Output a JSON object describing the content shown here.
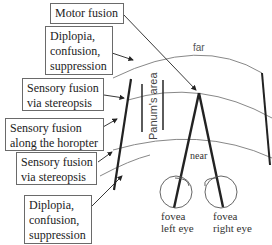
{
  "boxes": [
    {
      "id": "motor-fusion",
      "lines": [
        "Motor fusion"
      ]
    },
    {
      "id": "diplopia-upper",
      "lines": [
        "Diplopia,",
        "confusion,",
        "suppression"
      ]
    },
    {
      "id": "sensory-stereopsis-upper",
      "lines": [
        "Sensory fusion",
        "via stereopsis"
      ]
    },
    {
      "id": "sensory-horopter",
      "lines": [
        "Sensory fusion",
        "along the horopter"
      ]
    },
    {
      "id": "sensory-stereopsis-lower",
      "lines": [
        "Sensory fusion",
        "via stereopsis"
      ]
    },
    {
      "id": "diplopia-lower",
      "lines": [
        "Diplopia,",
        "confusion,",
        "suppression"
      ]
    }
  ],
  "labels": {
    "far": "far",
    "near": "near",
    "panum": "Panum's area",
    "left_eye": [
      "fovea",
      "left eye"
    ],
    "right_eye": [
      "fovea",
      "right eye"
    ]
  },
  "colors": {
    "line": "#222222",
    "arc": "#888888",
    "box_border": "#6a6a6a"
  }
}
